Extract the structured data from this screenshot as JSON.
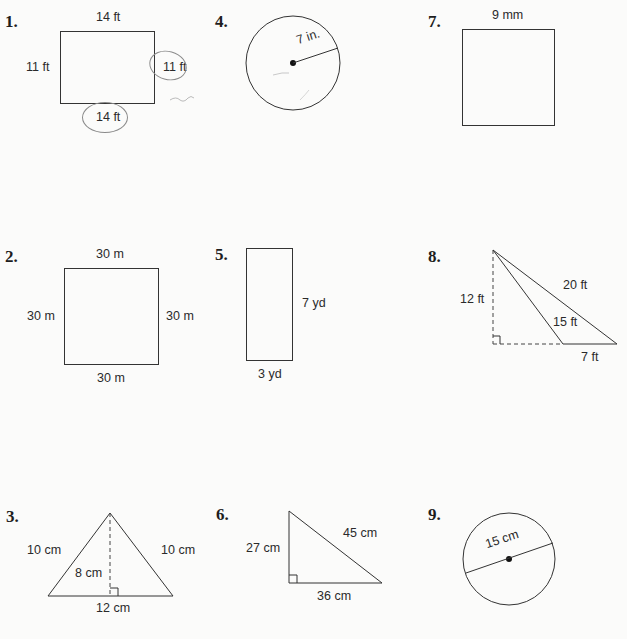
{
  "problems": [
    {
      "number": "1.",
      "shape": "rectangle",
      "labels": {
        "top": "14 ft",
        "left": "11 ft",
        "right": "11 ft",
        "bottom": "14 ft"
      },
      "annotations": "pencil circles around right and bottom labels"
    },
    {
      "number": "2.",
      "shape": "square",
      "labels": {
        "top": "30 m",
        "left": "30 m",
        "right": "30 m",
        "bottom": "30 m"
      }
    },
    {
      "number": "3.",
      "shape": "isosceles-triangle",
      "labels": {
        "left": "10 cm",
        "right": "10 cm",
        "height": "8 cm",
        "base": "12 cm"
      }
    },
    {
      "number": "4.",
      "shape": "circle",
      "labels": {
        "radius": "7 in."
      }
    },
    {
      "number": "5.",
      "shape": "rectangle",
      "labels": {
        "right": "7 yd",
        "bottom": "3 yd"
      }
    },
    {
      "number": "6.",
      "shape": "right-triangle",
      "labels": {
        "hypotenuse": "45 cm",
        "left": "27 cm",
        "base": "36 cm"
      }
    },
    {
      "number": "7.",
      "shape": "square",
      "labels": {
        "top": "9 mm"
      }
    },
    {
      "number": "8.",
      "shape": "obtuse-triangle",
      "labels": {
        "long_side": "20 ft",
        "height": "12 ft",
        "inner_side": "15 ft",
        "base": "7 ft"
      }
    },
    {
      "number": "9.",
      "shape": "circle",
      "labels": {
        "diameter": "15 cm"
      }
    }
  ]
}
